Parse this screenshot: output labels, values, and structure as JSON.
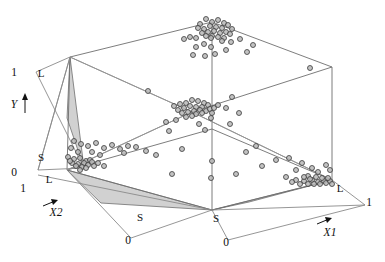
{
  "figure": {
    "title": "",
    "background": "#ffffff",
    "point_fill": "#b8b8b8",
    "point_stroke": "#3a3a3a",
    "shade_fill": "#c9c9c9",
    "wire_stroke": "#6e6e6e"
  },
  "axes": {
    "y": {
      "name": "Y",
      "label": "Y",
      "max_label": "1",
      "min_label": "0",
      "levels": [
        "L",
        "S"
      ]
    },
    "x1": {
      "name": "X1",
      "label": "X1",
      "max_label": "1",
      "min_label": "0",
      "levels": [
        "S",
        "L"
      ]
    },
    "x2": {
      "name": "X2",
      "label": "X2",
      "max_label": "1",
      "min_label": "0",
      "levels": [
        "S",
        "L"
      ]
    }
  },
  "labels": {
    "y_top_one": "1",
    "y_axis_name": "Y",
    "y_level_L": "L",
    "y_level_S": "S",
    "y_bottom_zero": "0",
    "x2_one": "1",
    "x2_level_L": "L",
    "x2_level_S": "S",
    "x2_zero": "0",
    "x2_name": "X2",
    "x1_level_S": "S",
    "x1_zero": "0",
    "x1_level_L": "L",
    "x1_one": "1",
    "x1_name": "X1"
  },
  "chart_data": {
    "type": "scatter",
    "title": "",
    "xlabel": "X1",
    "ylabel": "X2",
    "zlabel": "Y",
    "xlim": [
      0,
      1
    ],
    "ylim": [
      0,
      1
    ],
    "zlim": [
      0,
      1
    ],
    "grid": false,
    "legend": null,
    "projection": "3d-wireframe-cube",
    "annotations": [
      {
        "text": "L",
        "axis": "Y",
        "meaning": "large level"
      },
      {
        "text": "S",
        "axis": "Y",
        "meaning": "small level"
      },
      {
        "text": "L",
        "axis": "X1",
        "meaning": "large level"
      },
      {
        "text": "S",
        "axis": "X1",
        "meaning": "small level"
      },
      {
        "text": "L",
        "axis": "X2",
        "meaning": "large level"
      },
      {
        "text": "S",
        "axis": "X2",
        "meaning": "small level"
      }
    ],
    "clusters": [
      {
        "name": "top-apex-cluster",
        "x": 0.0,
        "y": 0.0,
        "z": 1.0,
        "count": 22
      },
      {
        "name": "mid-vertex-cluster",
        "x": 0.0,
        "y": 0.0,
        "z": 0.5,
        "count": 24
      },
      {
        "name": "left-floor-cluster",
        "x": 0.0,
        "y": 1.0,
        "z": 0.0,
        "count": 16
      },
      {
        "name": "right-floor-cluster",
        "x": 1.0,
        "y": 0.0,
        "z": 0.0,
        "count": 18
      }
    ],
    "points": [
      [
        212,
        22
      ],
      [
        206,
        19
      ],
      [
        218,
        20
      ],
      [
        224,
        23
      ],
      [
        200,
        24
      ],
      [
        210,
        26
      ],
      [
        216,
        27
      ],
      [
        222,
        28
      ],
      [
        204,
        29
      ],
      [
        228,
        25
      ],
      [
        198,
        28
      ],
      [
        232,
        29
      ],
      [
        208,
        32
      ],
      [
        214,
        31
      ],
      [
        220,
        33
      ],
      [
        226,
        32
      ],
      [
        202,
        33
      ],
      [
        230,
        34
      ],
      [
        212,
        36
      ],
      [
        218,
        37
      ],
      [
        206,
        36
      ],
      [
        224,
        38
      ],
      [
        190,
        37
      ],
      [
        196,
        38
      ],
      [
        184,
        39
      ],
      [
        211,
        38
      ],
      [
        240,
        39
      ],
      [
        222,
        41
      ],
      [
        204,
        44
      ],
      [
        196,
        47
      ],
      [
        231,
        42
      ],
      [
        253,
        45
      ],
      [
        247,
        52
      ],
      [
        211,
        47
      ],
      [
        226,
        50
      ],
      [
        193,
        55
      ],
      [
        205,
        56
      ],
      [
        215,
        54
      ],
      [
        310,
        68
      ],
      [
        148,
        91
      ],
      [
        186,
        103
      ],
      [
        192,
        100
      ],
      [
        198,
        101
      ],
      [
        180,
        104
      ],
      [
        204,
        103
      ],
      [
        174,
        106
      ],
      [
        190,
        106
      ],
      [
        196,
        107
      ],
      [
        184,
        108
      ],
      [
        202,
        107
      ],
      [
        178,
        110
      ],
      [
        208,
        105
      ],
      [
        194,
        111
      ],
      [
        200,
        110
      ],
      [
        188,
        112
      ],
      [
        206,
        111
      ],
      [
        182,
        113
      ],
      [
        210,
        109
      ],
      [
        196,
        114
      ],
      [
        202,
        113
      ],
      [
        214,
        108
      ],
      [
        218,
        105
      ],
      [
        192,
        116
      ],
      [
        186,
        117
      ],
      [
        232,
        97
      ],
      [
        166,
        122
      ],
      [
        176,
        120
      ],
      [
        226,
        108
      ],
      [
        212,
        113
      ],
      [
        211,
        118
      ],
      [
        199,
        124
      ],
      [
        169,
        131
      ],
      [
        205,
        130
      ],
      [
        239,
        113
      ],
      [
        230,
        124
      ],
      [
        74,
        141
      ],
      [
        81,
        144
      ],
      [
        88,
        146
      ],
      [
        96,
        143
      ],
      [
        104,
        148
      ],
      [
        112,
        145
      ],
      [
        120,
        149
      ],
      [
        128,
        146
      ],
      [
        92,
        152
      ],
      [
        100,
        155
      ],
      [
        71,
        148
      ],
      [
        78,
        152
      ],
      [
        68,
        157
      ],
      [
        74,
        159
      ],
      [
        80,
        158
      ],
      [
        86,
        161
      ],
      [
        72,
        163
      ],
      [
        78,
        164
      ],
      [
        84,
        163
      ],
      [
        90,
        160
      ],
      [
        76,
        166
      ],
      [
        82,
        167
      ],
      [
        70,
        161
      ],
      [
        88,
        165
      ],
      [
        92,
        162
      ],
      [
        86,
        168
      ],
      [
        94,
        166
      ],
      [
        80,
        170
      ],
      [
        98,
        163
      ],
      [
        104,
        166
      ],
      [
        156,
        155
      ],
      [
        182,
        149
      ],
      [
        212,
        161
      ],
      [
        172,
        174
      ],
      [
        246,
        152
      ],
      [
        211,
        178
      ],
      [
        276,
        160
      ],
      [
        289,
        158
      ],
      [
        262,
        166
      ],
      [
        296,
        170
      ],
      [
        302,
        163
      ],
      [
        312,
        168
      ],
      [
        318,
        172
      ],
      [
        308,
        176
      ],
      [
        326,
        165
      ],
      [
        330,
        170
      ],
      [
        286,
        177
      ],
      [
        296,
        180
      ],
      [
        304,
        181
      ],
      [
        312,
        180
      ],
      [
        318,
        182
      ],
      [
        324,
        181
      ],
      [
        308,
        184
      ],
      [
        314,
        184
      ],
      [
        320,
        184
      ],
      [
        326,
        183
      ],
      [
        330,
        181
      ],
      [
        300,
        184
      ],
      [
        292,
        182
      ],
      [
        322,
        178
      ],
      [
        316,
        177
      ],
      [
        310,
        179
      ],
      [
        304,
        177
      ],
      [
        328,
        178
      ],
      [
        332,
        184
      ],
      [
        136,
        147
      ],
      [
        146,
        151
      ],
      [
        124,
        153
      ],
      [
        236,
        174
      ],
      [
        256,
        146
      ]
    ]
  }
}
